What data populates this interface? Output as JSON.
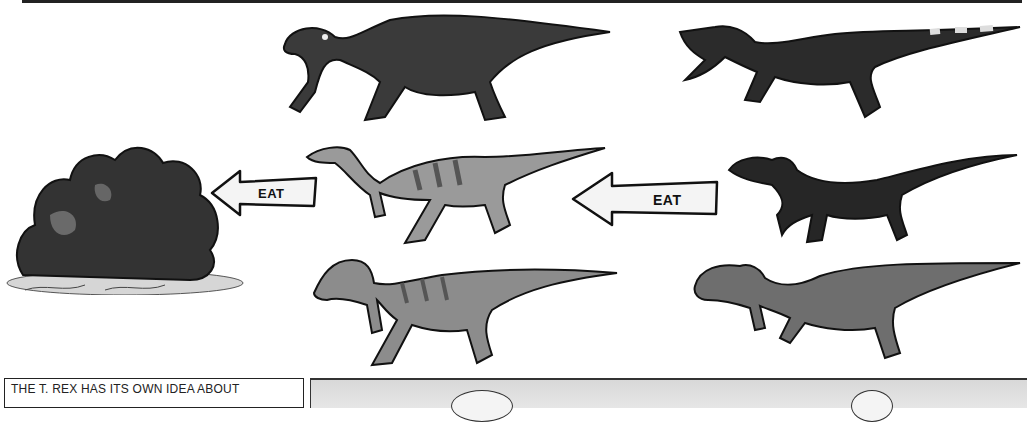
{
  "page": {
    "type": "comic-illustration"
  },
  "scene": {
    "plant": {
      "name": "bush",
      "label": ""
    },
    "arrows": [
      {
        "id": "arrow-left",
        "label": "EAT",
        "direction": "left"
      },
      {
        "id": "arrow-right",
        "label": "EAT",
        "direction": "left"
      }
    ],
    "herbivores": [
      {
        "name": "iguanodon",
        "color": "#3a3a3a"
      },
      {
        "name": "small-ornithopod",
        "color": "#9a9a9a"
      },
      {
        "name": "pachycephalosaurus",
        "color": "#8c8c8c"
      }
    ],
    "carnivores": [
      {
        "name": "baryonyx",
        "color": "#2b2b2b"
      },
      {
        "name": "feathered-raptor",
        "color": "#262626"
      },
      {
        "name": "tyrannosaurus-rex",
        "color": "#6e6e6e"
      }
    ]
  },
  "caption": {
    "text": "THE T. REX HAS ITS OWN IDEA ABOUT"
  }
}
